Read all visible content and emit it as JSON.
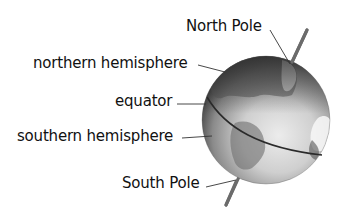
{
  "diagram": {
    "labels": {
      "north_pole": "North Pole",
      "northern_hemisphere": "northern hemisphere",
      "equator": "equator",
      "southern_hemisphere": "southern hemisphere",
      "south_pole": "South Pole"
    },
    "colors": {
      "background": "#ffffff",
      "text": "#111111",
      "leader_line": "#333333",
      "axis": "#6b6b6b",
      "equator_line": "#2a2a2a",
      "globe_light": "#e6e6e6",
      "globe_dark": "#3a3a3a"
    }
  }
}
